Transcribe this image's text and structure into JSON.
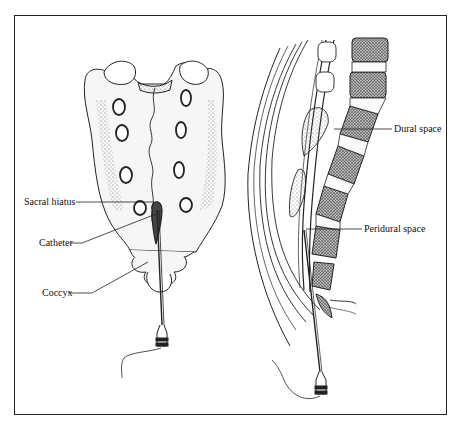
{
  "figure": {
    "left_panel": {
      "name": "Sacrum (posterior view)",
      "labels": [
        {
          "id": "sacral-hiatus",
          "text": "Sacral hiatus"
        },
        {
          "id": "catheter",
          "text": "Catheter"
        },
        {
          "id": "coccyx",
          "text": "Coccyx"
        }
      ]
    },
    "right_panel": {
      "name": "Lumbosacral spine (sagittal section)",
      "labels": [
        {
          "id": "dural-space",
          "text": "Dural space"
        },
        {
          "id": "peridural-space",
          "text": "Peridural space"
        }
      ]
    },
    "colors": {
      "line": "#222222",
      "bone_fill": "#f4f4f4",
      "stipple": "#777777",
      "background": "#ffffff"
    }
  }
}
